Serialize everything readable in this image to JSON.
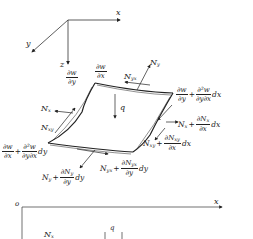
{
  "diagram": {
    "top_axes": {
      "x_label": "x",
      "y_label": "y",
      "z_label": "z"
    },
    "plate_labels": {
      "dw_dy": {
        "num": "∂w",
        "den": "∂y"
      },
      "dw_dx": {
        "num": "∂w",
        "den": "∂x"
      },
      "Ny": "N",
      "Ny_sub": "y",
      "Nyx": "N",
      "Nyx_sub": "yx",
      "q": "q",
      "Nx": "N",
      "Nx_sub": "x",
      "Nxy": "N",
      "Nxy_sub": "xy"
    },
    "right_edge": {
      "slope_expr": {
        "lead_num": "∂w",
        "lead_den": "∂y",
        "plus": "+",
        "num": "∂²w",
        "den": "∂y∂x",
        "tail": "dx"
      },
      "Nx_expr": {
        "lead": "N",
        "lead_sub": "x",
        "plus": "+",
        "num": "∂N",
        "num_sub": "x",
        "den": "∂x",
        "tail": "dx"
      },
      "Nxy_expr": {
        "lead": "N",
        "lead_sub": "xy",
        "plus": "+",
        "num": "∂N",
        "num_sub": "xy",
        "den": "∂x",
        "tail": "dx"
      }
    },
    "front_edge": {
      "slope_expr": {
        "lead_num": "∂w",
        "lead_den": "∂x",
        "plus": "+",
        "num": "∂²w",
        "den": "∂y∂x",
        "tail": "dy"
      },
      "Nyx_expr": {
        "lead": "N",
        "lead_sub": "yx",
        "plus": "+",
        "num": "∂N",
        "num_sub": "yx",
        "den": "∂y",
        "tail": "dy"
      },
      "Ny_expr": {
        "lead": "N",
        "lead_sub": "y",
        "plus": "+",
        "num": "∂N",
        "num_sub": "y",
        "den": "∂y",
        "tail": "dy"
      }
    },
    "bottom_axes": {
      "origin": "o",
      "x_label": "x",
      "q": "q",
      "Nx": "N",
      "Nx_sub": "x"
    }
  }
}
